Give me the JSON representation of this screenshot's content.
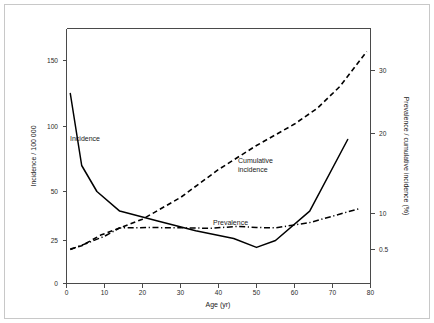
{
  "chart_data": {
    "type": "line",
    "title": "",
    "xlabel": "Age (yr)",
    "ylabel": "Incidence / 100 000",
    "y2label": "Prevalence / cumulative incidence (%)",
    "xlim": [
      0,
      80
    ],
    "xticks": [
      0,
      10,
      20,
      30,
      40,
      50,
      60,
      70,
      80
    ],
    "xticklabels": [
      "0",
      "10",
      "20",
      "30",
      "40",
      "50",
      "60",
      "70",
      "80"
    ],
    "yticks": [
      0,
      25,
      50,
      100,
      150
    ],
    "yticklabels": [
      "0",
      "25",
      "50",
      "100",
      "150"
    ],
    "ylim": [
      0,
      175
    ],
    "y2ticks": [
      0.5,
      10,
      20,
      30
    ],
    "y2ticklabels": [
      "0.5",
      "10",
      "20",
      "30"
    ],
    "y2lim": [
      0,
      35
    ],
    "grid": false,
    "legend_position": "inline-annotations",
    "series": [
      {
        "name": "Incidence",
        "axis": "left",
        "style": "solid",
        "label_text": "Incidence",
        "x": [
          1,
          4,
          8,
          14,
          24,
          34,
          44,
          50,
          55,
          64,
          74
        ],
        "values": [
          125,
          70,
          50,
          40,
          35,
          30,
          26,
          21,
          25,
          40,
          90
        ]
      },
      {
        "name": "Cumulative incidence",
        "axis": "right",
        "style": "dashed",
        "label_text": "Cumulative incidence",
        "x": [
          1,
          4,
          9,
          13,
          20,
          30,
          40,
          50,
          60,
          66,
          72,
          79
        ],
        "values": [
          0.6,
          1.5,
          4.3,
          5.8,
          8.5,
          12.0,
          15.5,
          18.5,
          21.5,
          24.0,
          27.5,
          33.0
        ]
      },
      {
        "name": "Prevalence",
        "axis": "right",
        "style": "dash-dot",
        "label_text": "Prevalence",
        "x": [
          1,
          5,
          10,
          14,
          22,
          32,
          38,
          45,
          50,
          55,
          64,
          77
        ],
        "values": [
          0.5,
          2.0,
          4.0,
          6.2,
          6.3,
          6.2,
          6.1,
          6.6,
          6.3,
          6.2,
          7.6,
          10.6
        ]
      }
    ],
    "annotations": [
      {
        "text": "Incidence",
        "x_px": 70,
        "y_px": 141
      },
      {
        "text": "Cumulative",
        "x_px": 238,
        "y_px": 163
      },
      {
        "text": "incidence",
        "x_px": 238,
        "y_px": 172
      },
      {
        "text": "Prevalence",
        "x_px": 213,
        "y_px": 225
      }
    ],
    "colors": {
      "line": "#000000",
      "axis": "#4a4a4a",
      "frame": "#c8c8c8",
      "background": "#ffffff",
      "text": "#1a1a1a"
    }
  }
}
